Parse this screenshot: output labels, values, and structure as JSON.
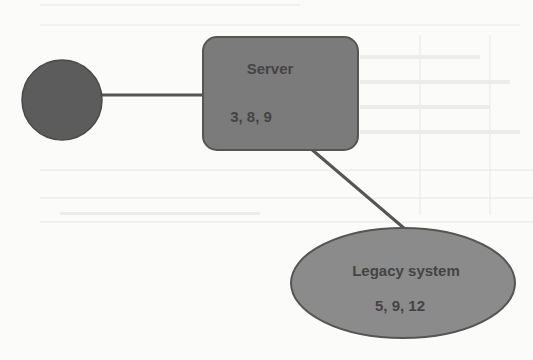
{
  "diagram": {
    "type": "network-topology",
    "nodes": [
      {
        "id": "client",
        "shape": "circle",
        "title": "",
        "values": "",
        "fill": "#5c5c5c",
        "stroke": "#4a4a4a"
      },
      {
        "id": "server",
        "shape": "rounded-rectangle",
        "title": "Server",
        "values": "3, 8, 9",
        "fill": "#7b7b7b",
        "stroke": "#555555"
      },
      {
        "id": "legacy",
        "shape": "ellipse",
        "title": "Legacy system",
        "values": "5, 9, 12",
        "fill": "#8b8b8b",
        "stroke": "#555555"
      }
    ],
    "edges": [
      {
        "from": "client",
        "to": "server"
      },
      {
        "from": "server",
        "to": "legacy"
      }
    ],
    "colors": {
      "background": "#fbfbfa",
      "edge": "#555555",
      "text": "#444444"
    }
  }
}
